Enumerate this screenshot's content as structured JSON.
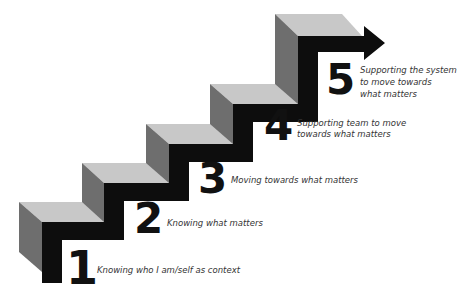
{
  "diagram": {
    "type": "staircase",
    "colors": {
      "top_face": "#c8c8c8",
      "side_face": "#6e6e6e",
      "front": "#0d0d0d",
      "text": "#333333",
      "number": "#111111"
    },
    "steps": [
      {
        "number": "1",
        "label_lines": [
          "Knowing who I am/self as context"
        ]
      },
      {
        "number": "2",
        "label_lines": [
          "Knowing what matters"
        ]
      },
      {
        "number": "3",
        "label_lines": [
          "Moving towards what matters"
        ]
      },
      {
        "number": "4",
        "label_lines": [
          "Supporting team to move",
          "towards what matters"
        ]
      },
      {
        "number": "5",
        "label_lines": [
          "Supporting the system",
          "to move towards",
          "what matters"
        ]
      }
    ],
    "arrow": "arrow-right"
  }
}
